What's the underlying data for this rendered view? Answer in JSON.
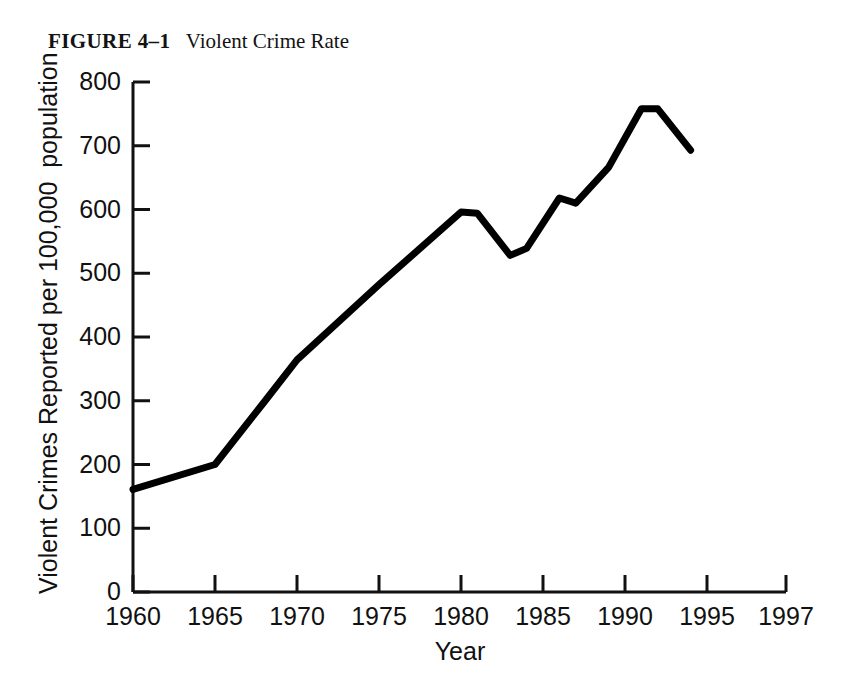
{
  "figure": {
    "label": "FIGURE 4–1",
    "title": "Violent Crime Rate"
  },
  "chart_data": {
    "type": "line",
    "title": "Violent Crime Rate",
    "xlabel": "Year",
    "ylabel": "Violent Crimes Reported per 100,000  population",
    "xlim": [
      1960,
      1997
    ],
    "ylim": [
      0,
      800
    ],
    "grid": false,
    "legend": "none",
    "line_color": "#000000",
    "line_width_px": 7,
    "xticks": [
      1960,
      1965,
      1970,
      1975,
      1980,
      1985,
      1990,
      1995,
      1997
    ],
    "xtick_labels": [
      "1960",
      "1965",
      "1970",
      "1975",
      "1980",
      "1985",
      "1990",
      "1995",
      "1997"
    ],
    "yticks": [
      0,
      100,
      200,
      300,
      400,
      500,
      600,
      700,
      800
    ],
    "ytick_labels": [
      "0",
      "100",
      "200",
      "300",
      "400",
      "500",
      "600",
      "700",
      "800"
    ],
    "series": [
      {
        "name": "Violent crime rate",
        "x": [
          1960,
          1965,
          1968,
          1970,
          1975,
          1980,
          1981,
          1983,
          1984,
          1986,
          1987,
          1989,
          1991,
          1992,
          1994
        ],
        "values": [
          161,
          200,
          298,
          364,
          482,
          596,
          594,
          528,
          539,
          618,
          610,
          666,
          758,
          758,
          693
        ]
      }
    ]
  },
  "axis": {
    "y_tick_values": [
      "800",
      "700",
      "600",
      "500",
      "400",
      "300",
      "200",
      "100",
      "0"
    ],
    "x_tick_values": [
      "1960",
      "1965",
      "1970",
      "1975",
      "1980",
      "1985",
      "1990",
      "1995",
      "1997"
    ]
  }
}
